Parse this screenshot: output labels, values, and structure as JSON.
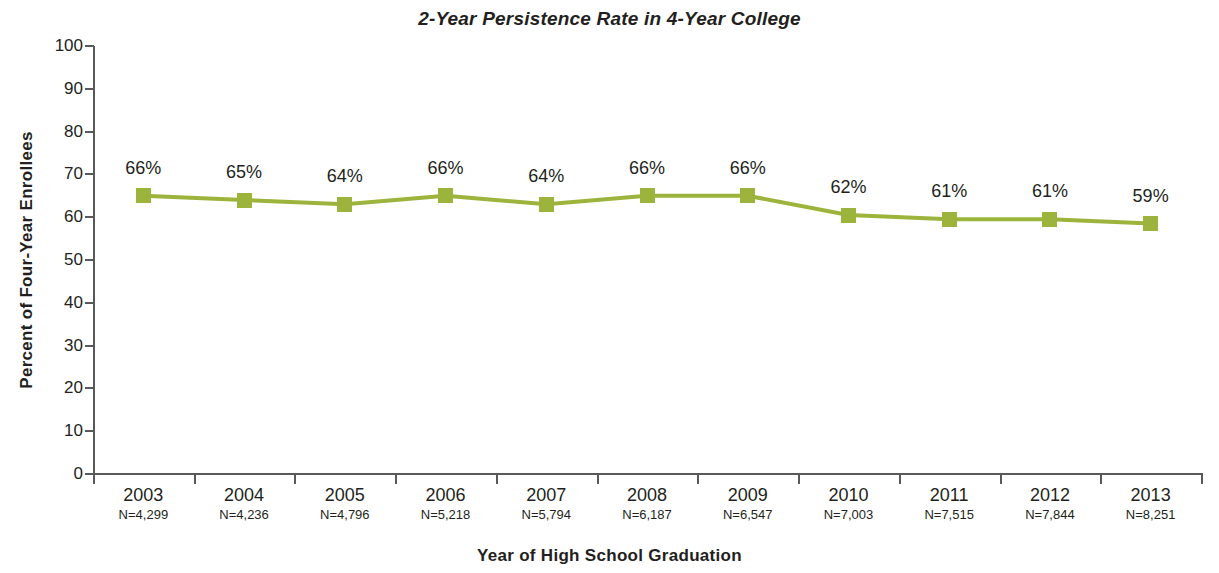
{
  "chart_data": {
    "type": "line",
    "title": "2-Year Persistence Rate in 4-Year College",
    "xlabel": "Year of High School Graduation",
    "ylabel": "Percent of Four-Year Enrollees",
    "categories": [
      "2003",
      "2004",
      "2005",
      "2006",
      "2007",
      "2008",
      "2009",
      "2010",
      "2011",
      "2012",
      "2013"
    ],
    "category_sublabels": [
      "N=4,299",
      "N=4,236",
      "N=4,796",
      "N=5,218",
      "N=5,794",
      "N=6,187",
      "N=6,547",
      "N=7,003",
      "N=7,515",
      "N=7,844",
      "N=8,251"
    ],
    "values": [
      65,
      64,
      63,
      65,
      63,
      65,
      65,
      60.5,
      59.5,
      59.5,
      58.5
    ],
    "data_labels": [
      "66%",
      "65%",
      "64%",
      "66%",
      "64%",
      "66%",
      "66%",
      "62%",
      "61%",
      "61%",
      "59%"
    ],
    "ylim": [
      0,
      100
    ],
    "ytick_values": [
      0,
      10,
      20,
      30,
      40,
      50,
      60,
      70,
      80,
      90,
      100
    ],
    "ytick_labels": [
      "0",
      "10",
      "20",
      "30",
      "40",
      "50",
      "60",
      "70",
      "80",
      "90",
      "100"
    ],
    "grid": false,
    "legend": "none",
    "series": [
      {
        "name": "2-Year Persistence Rate",
        "color": "#9cb43c",
        "marker": "square",
        "values": [
          65,
          64,
          63,
          65,
          63,
          65,
          65,
          60.5,
          59.5,
          59.5,
          58.5
        ]
      }
    ]
  }
}
